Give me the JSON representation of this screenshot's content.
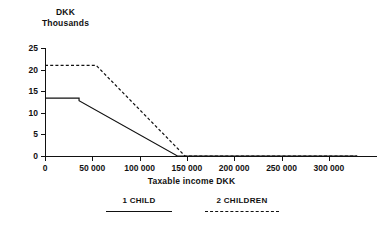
{
  "chart_data": {
    "type": "line",
    "title": "",
    "subtitle": "",
    "ylabel_line1": "DKK",
    "ylabel_line2": "Thousands",
    "xlabel": "Taxable income DKK",
    "xlim": [
      0,
      330000
    ],
    "ylim": [
      0,
      25
    ],
    "grid": false,
    "legend_position": "bottom",
    "x_ticks": [
      0,
      50000,
      100000,
      150000,
      200000,
      250000,
      300000
    ],
    "x_tick_labels": [
      "0",
      "50 000",
      "100 000",
      "150 000",
      "200 000",
      "250 000",
      "300 000"
    ],
    "y_ticks": [
      0,
      5,
      10,
      15,
      20,
      25
    ],
    "y_tick_labels": [
      "0",
      "5",
      "10",
      "15",
      "20",
      "25"
    ],
    "series": [
      {
        "name": "1 CHILD",
        "style": "solid",
        "color": "#111111",
        "x": [
          0,
          36000,
          36000,
          140000,
          330000
        ],
        "values": [
          13.4,
          13.4,
          12.8,
          0,
          0
        ]
      },
      {
        "name": "2 CHILDREN",
        "style": "dashed",
        "color": "#111111",
        "x": [
          0,
          54000,
          148000,
          330000
        ],
        "values": [
          21.0,
          21.0,
          0,
          0
        ]
      }
    ],
    "legend": [
      {
        "label": "1 CHILD",
        "style": "solid"
      },
      {
        "label": "2 CHILDREN",
        "style": "dashed"
      }
    ]
  }
}
